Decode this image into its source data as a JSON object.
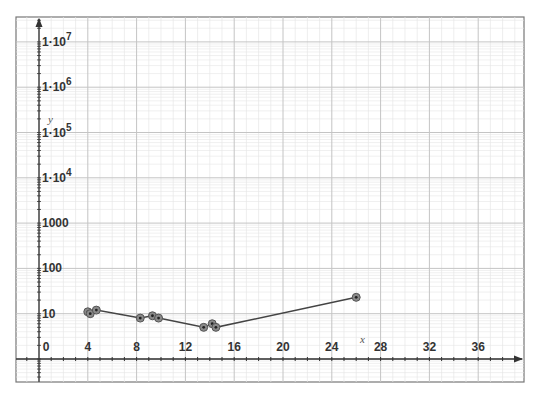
{
  "chart_data": {
    "type": "line",
    "title": "",
    "xlabel": "x",
    "ylabel": "y",
    "x_scale": "linear",
    "y_scale": "log",
    "xlim": [
      -2,
      39
    ],
    "ylim": [
      0.35,
      30000000.0
    ],
    "x_ticks": [
      0,
      4,
      8,
      12,
      16,
      20,
      24,
      28,
      32,
      36
    ],
    "x_tick_labels": [
      "0",
      "4",
      "8",
      "12",
      "16",
      "20",
      "24",
      "28",
      "32",
      "36"
    ],
    "y_ticks": [
      10,
      100,
      1000,
      10000,
      100000,
      1000000,
      10000000
    ],
    "y_tick_labels": [
      {
        "base": "10",
        "exp": ""
      },
      {
        "base": "100",
        "exp": ""
      },
      {
        "base": "1000",
        "exp": ""
      },
      {
        "base": "1·10",
        "exp": "4"
      },
      {
        "base": "1·10",
        "exp": "5"
      },
      {
        "base": "1·10",
        "exp": "6"
      },
      {
        "base": "1·10",
        "exp": "7"
      }
    ],
    "grid": true,
    "legend": null,
    "series": [
      {
        "name": "data",
        "marker": "circle",
        "connected": true,
        "points": [
          {
            "x": 4.0,
            "y": 11
          },
          {
            "x": 4.2,
            "y": 10
          },
          {
            "x": 4.7,
            "y": 12
          },
          {
            "x": 8.3,
            "y": 8
          },
          {
            "x": 9.3,
            "y": 9
          },
          {
            "x": 9.8,
            "y": 8
          },
          {
            "x": 13.5,
            "y": 5
          },
          {
            "x": 14.2,
            "y": 6
          },
          {
            "x": 14.5,
            "y": 5
          },
          {
            "x": 26.0,
            "y": 23
          }
        ]
      }
    ]
  },
  "colors": {
    "grid_major": "#c4c4c4",
    "grid_minor": "#e6e6e6",
    "axis": "#333333",
    "frame": "#777777",
    "line": "#444444",
    "marker_fill": "#8a8a8a",
    "marker_center": "#222222"
  }
}
